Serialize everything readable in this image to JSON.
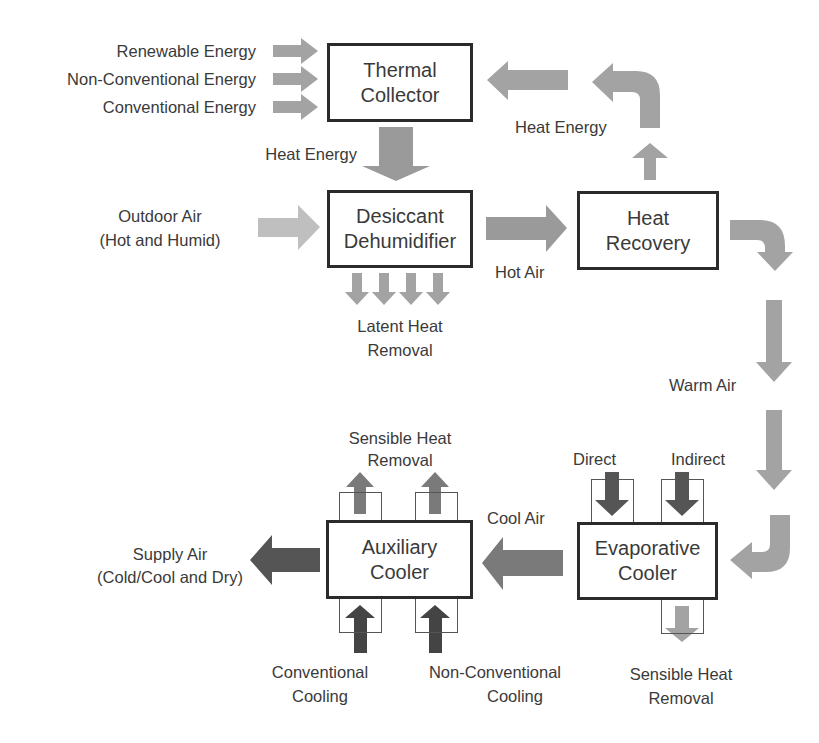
{
  "colors": {
    "box_border": "#2b2b2b",
    "arrow_light": "#bfbfbf",
    "arrow_medium": "#a3a3a3",
    "arrow_gray": "#9a9a9a",
    "arrow_mid_dark": "#7a7a7a",
    "arrow_dark": "#555555",
    "text": "#3a3a3a"
  },
  "boxes": {
    "thermal_collector": {
      "line1": "Thermal",
      "line2": "Collector"
    },
    "desiccant_dehumidifier": {
      "line1": "Desiccant",
      "line2": "Dehumidifier"
    },
    "heat_recovery": {
      "line1": "Heat",
      "line2": "Recovery"
    },
    "evaporative_cooler": {
      "line1": "Evaporative",
      "line2": "Cooler"
    },
    "auxiliary_cooler": {
      "line1": "Auxiliary",
      "line2": "Cooler"
    }
  },
  "labels": {
    "renewable_energy": "Renewable Energy",
    "non_conventional_energy": "Non-Conventional Energy",
    "conventional_energy": "Conventional Energy",
    "heat_energy_down": "Heat Energy",
    "heat_energy_return": "Heat Energy",
    "outdoor_air_1": "Outdoor Air",
    "outdoor_air_2": "(Hot and Humid)",
    "latent_heat_1": "Latent Heat",
    "latent_heat_2": "Removal",
    "hot_air": "Hot Air",
    "warm_air": "Warm Air",
    "direct": "Direct",
    "indirect": "Indirect",
    "evap_sensible_1": "Sensible Heat",
    "evap_sensible_2": "Removal",
    "cool_air": "Cool Air",
    "aux_sensible_1": "Sensible Heat",
    "aux_sensible_2": "Removal",
    "supply_air_1": "Supply Air",
    "supply_air_2": "(Cold/Cool and Dry)",
    "conv_cooling_1": "Conventional",
    "conv_cooling_2": "Cooling",
    "nonconv_cooling_1": "Non-Conventional",
    "nonconv_cooling_2": "Cooling"
  }
}
